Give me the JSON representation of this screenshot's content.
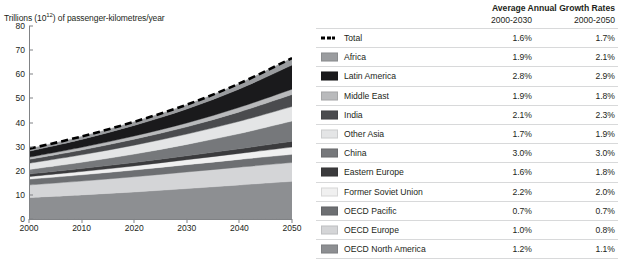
{
  "chart_data": {
    "type": "area",
    "stacked": true,
    "title": "",
    "xlabel": "",
    "ylabel": "Trillions (10^12) of passenger-kilometres/year",
    "ylabel_prefix": "Trillions (10",
    "ylabel_exponent": "12",
    "ylabel_suffix": ") of passenger-kilometres/year",
    "x": [
      2000,
      2010,
      2020,
      2030,
      2040,
      2050
    ],
    "xlim": [
      2000,
      2050
    ],
    "ylim": [
      0,
      80
    ],
    "yticks": [
      0,
      10,
      20,
      30,
      40,
      50,
      60,
      70,
      80
    ],
    "xticks": [
      2000,
      2010,
      2020,
      2030,
      2040,
      2050
    ],
    "grid": false,
    "legend_position": "right-table",
    "series": [
      {
        "name": "OECD North America",
        "color": "#8d8f92",
        "order": 1,
        "values": [
          8.9,
          10.0,
          11.2,
          12.6,
          14.1,
          15.6
        ]
      },
      {
        "name": "OECD Europe",
        "color": "#d4d5d7",
        "order": 2,
        "values": [
          5.2,
          5.7,
          6.3,
          6.9,
          7.4,
          7.8
        ]
      },
      {
        "name": "OECD Pacific",
        "color": "#6d6f72",
        "order": 3,
        "values": [
          2.4,
          2.6,
          2.8,
          3.0,
          3.2,
          3.4
        ]
      },
      {
        "name": "Former Soviet Union",
        "color": "#f0f0f0",
        "order": 4,
        "values": [
          1.1,
          1.4,
          1.7,
          2.1,
          2.5,
          3.0
        ]
      },
      {
        "name": "Eastern Europe",
        "color": "#3b3b3d",
        "order": 5,
        "values": [
          1.0,
          1.2,
          1.4,
          1.6,
          1.9,
          2.4
        ]
      },
      {
        "name": "China",
        "color": "#76787b",
        "order": 6,
        "values": [
          1.9,
          2.6,
          3.5,
          4.7,
          6.3,
          8.4
        ]
      },
      {
        "name": "Other Asia",
        "color": "#e4e5e6",
        "order": 7,
        "values": [
          2.6,
          3.1,
          3.7,
          4.3,
          5.1,
          6.0
        ]
      },
      {
        "name": "India",
        "color": "#4a4b4e",
        "order": 8,
        "values": [
          1.6,
          2.0,
          2.5,
          3.0,
          3.9,
          5.0
        ]
      },
      {
        "name": "Middle East",
        "color": "#b9babc",
        "order": 9,
        "values": [
          0.9,
          1.1,
          1.3,
          1.6,
          1.9,
          2.2
        ]
      },
      {
        "name": "Latin America",
        "color": "#1a1a1c",
        "order": 10,
        "values": [
          2.5,
          3.3,
          4.4,
          5.8,
          7.6,
          10.0
        ]
      },
      {
        "name": "Africa",
        "color": "#9a9c9f",
        "order": 11,
        "values": [
          1.0,
          1.2,
          1.5,
          1.8,
          2.3,
          2.9
        ]
      }
    ],
    "total_line": {
      "name": "Total",
      "style": "dashed",
      "color": "#000000",
      "values": [
        29.1,
        34.2,
        40.3,
        47.4,
        56.2,
        66.7
      ]
    }
  },
  "legend": {
    "header": {
      "title": "Average Annual Growth Rates",
      "col1": "2000-2030",
      "col2": "2000-2050"
    },
    "rows": [
      {
        "label": "Total",
        "swatch": "dashed",
        "color": "#000000",
        "g1": "1.6%",
        "g2": "1.7%"
      },
      {
        "label": "Africa",
        "swatch": "solid",
        "color": "#9a9c9f",
        "g1": "1.9%",
        "g2": "2.1%"
      },
      {
        "label": "Latin America",
        "swatch": "solid",
        "color": "#1a1a1c",
        "g1": "2.8%",
        "g2": "2.9%"
      },
      {
        "label": "Middle East",
        "swatch": "solid",
        "color": "#b9babc",
        "g1": "1.9%",
        "g2": "1.8%"
      },
      {
        "label": "India",
        "swatch": "solid",
        "color": "#4a4b4e",
        "g1": "2.1%",
        "g2": "2.3%"
      },
      {
        "label": "Other Asia",
        "swatch": "solid",
        "color": "#e4e5e6",
        "g1": "1.7%",
        "g2": "1.9%"
      },
      {
        "label": "China",
        "swatch": "solid",
        "color": "#76787b",
        "g1": "3.0%",
        "g2": "3.0%"
      },
      {
        "label": "Eastern Europe",
        "swatch": "solid",
        "color": "#3b3b3d",
        "g1": "1.6%",
        "g2": "1.8%"
      },
      {
        "label": "Former Soviet Union",
        "swatch": "solid",
        "color": "#f0f0f0",
        "g1": "2.2%",
        "g2": "2.0%"
      },
      {
        "label": "OECD Pacific",
        "swatch": "solid",
        "color": "#6d6f72",
        "g1": "0.7%",
        "g2": "0.7%"
      },
      {
        "label": "OECD Europe",
        "swatch": "solid",
        "color": "#d4d5d7",
        "g1": "1.0%",
        "g2": "0.8%"
      },
      {
        "label": "OECD North America",
        "swatch": "solid",
        "color": "#8d8f92",
        "g1": "1.2%",
        "g2": "1.1%"
      }
    ]
  },
  "axis": {
    "yticks": [
      "80",
      "70",
      "60",
      "50",
      "40",
      "30",
      "20",
      "10",
      "0"
    ],
    "xticks": [
      "2000",
      "2010",
      "2020",
      "2030",
      "2040",
      "2050"
    ]
  }
}
